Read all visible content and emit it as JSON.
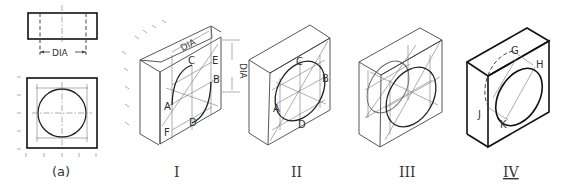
{
  "figure": {
    "panels": [
      {
        "id": "a",
        "caption": "(a)",
        "dimension_label": "DIA"
      },
      {
        "id": "I",
        "caption": "I",
        "dimension_labels": [
          "DIA",
          "DIA"
        ],
        "points": [
          "A",
          "B",
          "C",
          "D",
          "E",
          "F"
        ]
      },
      {
        "id": "II",
        "caption": "II",
        "points": [
          "A",
          "B",
          "C",
          "D"
        ]
      },
      {
        "id": "III",
        "caption": "III"
      },
      {
        "id": "IV",
        "caption": "IV",
        "points": [
          "G",
          "H",
          "J",
          "K"
        ]
      }
    ]
  },
  "labels": {
    "a_dim": "DIA",
    "a_cap": "(a)",
    "I_dim_top": "DIA",
    "I_dim_side": "DIA",
    "I_A": "A",
    "I_B": "B",
    "I_C": "C",
    "I_D": "D",
    "I_E": "E",
    "I_F": "F",
    "I_cap": "I",
    "II_A": "A",
    "II_B": "B",
    "II_C": "C",
    "II_D": "D",
    "II_cap": "II",
    "III_cap": "III",
    "IV_G": "G",
    "IV_H": "H",
    "IV_J": "J",
    "IV_K": "K",
    "IV_cap": "IV"
  }
}
